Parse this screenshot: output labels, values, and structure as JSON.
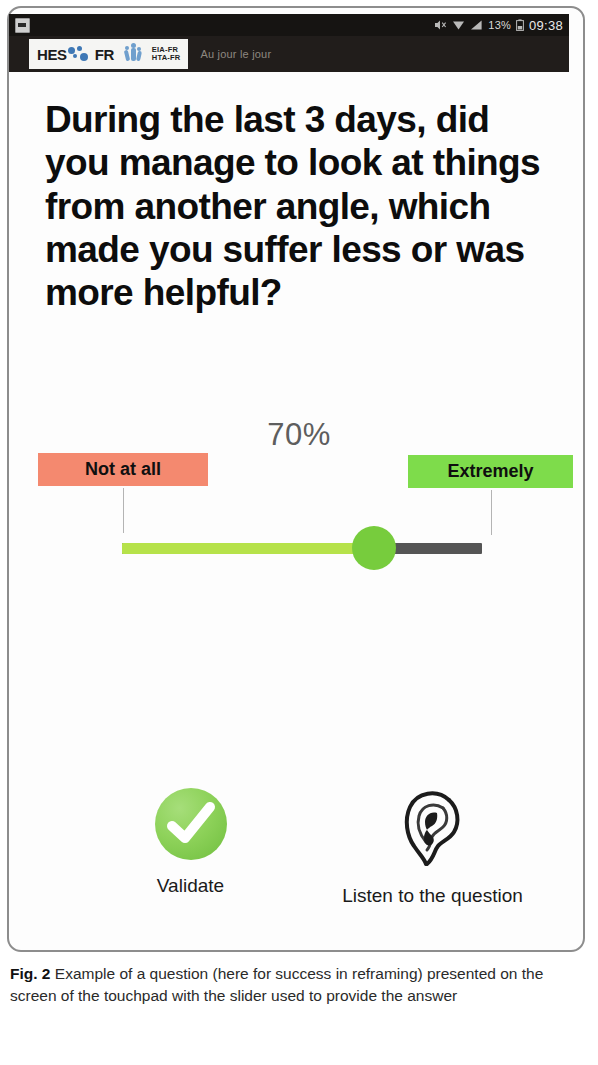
{
  "status_bar": {
    "battery_percent": "13%",
    "clock": "09:38",
    "icons": [
      "screenshot-icon",
      "mute-icon",
      "wifi-icon",
      "signal-icon",
      "battery-icon"
    ]
  },
  "app_header": {
    "logo_primary": "HES",
    "logo_secondary": "FR",
    "logo_subtitle": "Haute Ecole Specialisee",
    "logo_code_1": "EIA-FR",
    "logo_code_2": "HTA-FR",
    "tagline": "Au jour le jour"
  },
  "question": {
    "text": "During the last 3 days, did you manage to look at things from another angle, which made you suffer less or was more helpful?"
  },
  "slider": {
    "value_label": "70%",
    "value": 70,
    "min": 0,
    "max": 100,
    "left_anchor": "Not at all",
    "right_anchor": "Extremely",
    "left_anchor_color": "#f4896f",
    "right_anchor_color": "#7edc4b",
    "fill_color": "#b6e24a",
    "thumb_color": "#77cc3d",
    "track_color": "#555555"
  },
  "actions": {
    "validate": {
      "label": "Validate",
      "icon": "check-circle-icon",
      "color": "#8ed25a"
    },
    "listen": {
      "label": "Listen to the question",
      "icon": "ear-icon"
    }
  },
  "caption": {
    "figure_number": "Fig. 2",
    "text": "Example of a question (here for success in reframing) presented on the screen of the touchpad with the slider used to provide the answer"
  }
}
